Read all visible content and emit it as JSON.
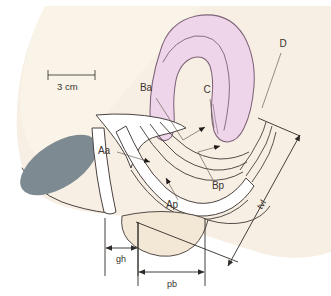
{
  "figure": {
    "scale_bar": {
      "label": "3 cm",
      "name": "scale-bar"
    },
    "colors": {
      "background": "#ffffff",
      "tissue_beige": "#f6ebdb",
      "tissue_beige_light": "#faf3e8",
      "uterus_pink": "#eed2ea",
      "uterus_pink_edge": "#8d6f87",
      "rectum_gray": "#7e8a92",
      "outline_dark": "#4a4340",
      "leader_gray": "#6b6159",
      "text": "#3a3330",
      "white_lumen": "#ffffff"
    },
    "labels": [
      {
        "id": "D",
        "text": "D",
        "name": "label-D",
        "x": 283,
        "y": 47
      },
      {
        "id": "C",
        "text": "C",
        "name": "label-C",
        "x": 207,
        "y": 93
      },
      {
        "id": "Ba",
        "text": "Ba",
        "name": "label-Ba",
        "x": 143,
        "y": 90
      },
      {
        "id": "Aa",
        "text": "Aa",
        "name": "label-Aa",
        "x": 99,
        "y": 152
      },
      {
        "id": "Ap",
        "text": "Ap",
        "name": "label-Ap",
        "x": 168,
        "y": 206
      },
      {
        "id": "Bp",
        "text": "Bp",
        "name": "label-Bp",
        "x": 214,
        "y": 186
      }
    ],
    "measurements": [
      {
        "id": "gh",
        "text": "gh",
        "name": "measure-gh",
        "x": 119,
        "y": 258
      },
      {
        "id": "pb",
        "text": "pb",
        "name": "measure-pb",
        "x": 174,
        "y": 284
      },
      {
        "id": "tvl",
        "text": "tvl",
        "name": "measure-tvl",
        "x": 264,
        "y": 205,
        "rotation": -55
      }
    ],
    "structures": [
      {
        "name": "uterus-body",
        "description": "pink curved uterine corpus"
      },
      {
        "name": "cervix",
        "description": "pink cervix, point C"
      },
      {
        "name": "vaginal-canal",
        "description": "white vaginal lumen"
      },
      {
        "name": "bladder",
        "description": "white anterior funnel structure"
      },
      {
        "name": "rectum",
        "description": "gray ellipse"
      },
      {
        "name": "perineal-body",
        "description": "beige perineal body"
      }
    ]
  }
}
